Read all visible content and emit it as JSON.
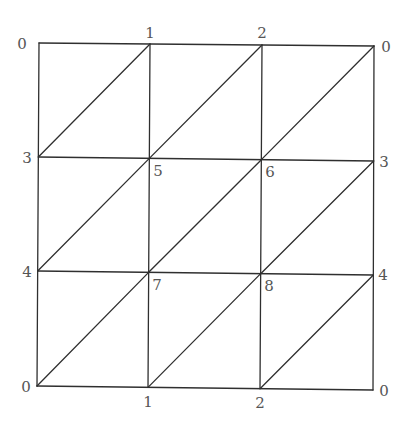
{
  "diagram": {
    "type": "triangulated-mesh",
    "colors": {
      "edge": "#2f2f2f",
      "label": "#555555",
      "background": "#ffffff"
    },
    "grid": {
      "rows": 3,
      "cols": 3,
      "x_positions_top": [
        39,
        150,
        262,
        374
      ],
      "x_positions_bottom": [
        37,
        148,
        260,
        373
      ],
      "y_positions_left": [
        43,
        157,
        271,
        386
      ],
      "y_positions_right": [
        46,
        161,
        275,
        390
      ]
    },
    "node_ids": [
      [
        0,
        1,
        2,
        0
      ],
      [
        3,
        5,
        6,
        3
      ],
      [
        4,
        7,
        8,
        4
      ],
      [
        0,
        1,
        2,
        0
      ]
    ],
    "labels": [
      {
        "id": "top-left",
        "text": "0",
        "x": 22,
        "y": 49,
        "anchor": "middle"
      },
      {
        "id": "top-1",
        "text": "1",
        "x": 150,
        "y": 38,
        "anchor": "middle"
      },
      {
        "id": "top-2",
        "text": "2",
        "x": 262,
        "y": 38,
        "anchor": "middle"
      },
      {
        "id": "top-right",
        "text": "0",
        "x": 386,
        "y": 52,
        "anchor": "middle"
      },
      {
        "id": "left-3",
        "text": "3",
        "x": 27,
        "y": 163,
        "anchor": "middle"
      },
      {
        "id": "inner-5",
        "text": "5",
        "x": 158,
        "y": 176,
        "anchor": "middle"
      },
      {
        "id": "inner-6",
        "text": "6",
        "x": 270,
        "y": 177,
        "anchor": "middle"
      },
      {
        "id": "right-3",
        "text": "3",
        "x": 384,
        "y": 167,
        "anchor": "middle"
      },
      {
        "id": "left-4",
        "text": "4",
        "x": 27,
        "y": 277,
        "anchor": "middle"
      },
      {
        "id": "inner-7",
        "text": "7",
        "x": 157,
        "y": 290,
        "anchor": "middle"
      },
      {
        "id": "inner-8",
        "text": "8",
        "x": 269,
        "y": 291,
        "anchor": "middle"
      },
      {
        "id": "right-4",
        "text": "4",
        "x": 383,
        "y": 280,
        "anchor": "middle"
      },
      {
        "id": "bottom-left",
        "text": "0",
        "x": 26,
        "y": 392,
        "anchor": "middle"
      },
      {
        "id": "bottom-1",
        "text": "1",
        "x": 148,
        "y": 407,
        "anchor": "middle"
      },
      {
        "id": "bottom-2",
        "text": "2",
        "x": 260,
        "y": 408,
        "anchor": "middle"
      },
      {
        "id": "bottom-right",
        "text": "0",
        "x": 384,
        "y": 396,
        "anchor": "middle"
      }
    ]
  }
}
